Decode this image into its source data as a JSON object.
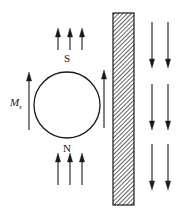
{
  "figure": {
    "background_color": "#ffffff",
    "stroke_color": "#1a1a1a",
    "hatch_color": "#4d4d4d",
    "width": 181,
    "height": 216
  },
  "sphere": {
    "name": "magnetized-sphere",
    "cx": 67,
    "cy": 105,
    "r": 33,
    "stroke_width": 1.3,
    "pole_top_label": "S",
    "pole_bottom_label": "N"
  },
  "magnetization": {
    "label_main": "M",
    "label_sub": "s",
    "arrow_direction": "up",
    "x": 29,
    "y_tail": 130,
    "y_head": 72
  },
  "barrier": {
    "name": "hatched-barrier",
    "x": 113,
    "y": 13,
    "width": 21,
    "height": 192,
    "hatch_pattern": "diagonal",
    "hatch_spacing": 3
  },
  "arrows": {
    "top_group": {
      "label": "upward-field-arrows-above-sphere",
      "direction": "up",
      "count": 3,
      "xs": [
        58,
        70,
        82
      ],
      "y_tail": 50,
      "y_head": 28
    },
    "bottom_group": {
      "label": "upward-field-arrows-below-sphere",
      "direction": "up",
      "count": 3,
      "xs": [
        58,
        70,
        82
      ],
      "y_tail": 185,
      "y_head": 153
    },
    "middle_single": {
      "label": "upward-field-arrow-between-sphere-and-barrier",
      "direction": "up",
      "count": 1,
      "xs": [
        104
      ],
      "y_tail": 128,
      "y_head": 70
    },
    "right_groups": {
      "label": "downward-field-arrows-right-of-barrier",
      "direction": "down",
      "columns": [
        152,
        168
      ],
      "rows": [
        {
          "y_tail": 22,
          "y_head": 68
        },
        {
          "y_tail": 84,
          "y_head": 130
        },
        {
          "y_tail": 144,
          "y_head": 190
        }
      ]
    }
  },
  "arrow_style": {
    "shaft_width": 1.1,
    "head_length": 9,
    "head_half_width": 2.6
  }
}
